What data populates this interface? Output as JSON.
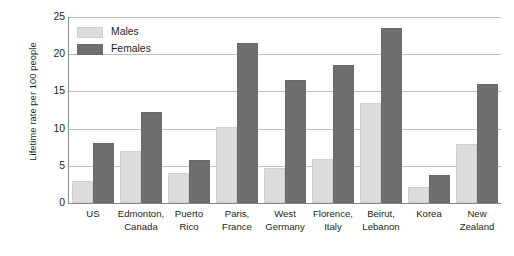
{
  "chart_data": {
    "type": "bar",
    "title": "",
    "subtitle": "",
    "xlabel": "",
    "ylabel": "Lifetime rate per 100 people",
    "ylim": [
      0,
      25
    ],
    "yticks": [
      0,
      5,
      10,
      15,
      20,
      25
    ],
    "ytick_labels": [
      "0",
      "5",
      "10",
      "15",
      "20",
      "25"
    ],
    "grid": true,
    "grid_axis": "y",
    "legend_position": "top-left-inside",
    "orientation": "vertical",
    "grouping": "grouped",
    "categories": [
      "US",
      "Edmonton, Canada",
      "Puerto Rico",
      "Paris, France",
      "West Germany",
      "Florence, Italy",
      "Beirut, Lebanon",
      "Korea",
      "New Zealand"
    ],
    "category_lines": [
      [
        "US",
        ""
      ],
      [
        "Edmonton,",
        "Canada"
      ],
      [
        "Puerto",
        "Rico"
      ],
      [
        "Paris,",
        "France"
      ],
      [
        "West",
        "Germany"
      ],
      [
        "Florence,",
        "Italy"
      ],
      [
        "Beirut,",
        "Lebanon"
      ],
      [
        "Korea",
        ""
      ],
      [
        "New",
        "Zealand"
      ]
    ],
    "series": [
      {
        "name": "Males",
        "color": "#dcdcdc",
        "values": [
          3.0,
          7.0,
          4.0,
          10.2,
          4.7,
          5.9,
          13.4,
          2.2,
          7.9
        ]
      },
      {
        "name": "Females",
        "color": "#706f6f",
        "values": [
          8.0,
          12.3,
          5.8,
          21.5,
          16.6,
          18.6,
          23.5,
          3.8,
          16.0
        ]
      }
    ]
  },
  "legend": {
    "items": [
      {
        "label": "Males",
        "color": "#dcdcdc"
      },
      {
        "label": "Females",
        "color": "#706f6f"
      }
    ]
  },
  "axes": {
    "y_title": "Lifetime rate per 100 people"
  },
  "colors": {
    "males_fill": "#dcdcdc",
    "females_fill": "#706f6f",
    "gridline": "#bfbfbf",
    "axis_line": "#8a8a8a",
    "text": "#231f20",
    "background": "#ffffff"
  }
}
